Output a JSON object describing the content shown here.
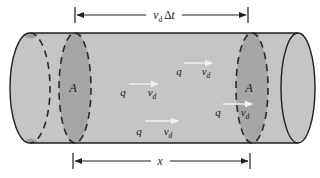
{
  "figure": {
    "colors": {
      "background": "#ffffff",
      "body": "#c5c5c5",
      "cap": "#c9c9c9",
      "cross_section": "#a6a6a6",
      "outline": "#1f1f1f",
      "charge_arrow": "#f2f2f2",
      "text": "#1a1a1a"
    },
    "top_dimension": {
      "v": "v",
      "v_sub": "d",
      "delta": "Δ",
      "t": "t"
    },
    "bottom_dimension": {
      "label": "x"
    },
    "cross_sections": [
      {
        "label": "A"
      },
      {
        "label": "A"
      }
    ],
    "charges": [
      {
        "q": "q",
        "v": "v",
        "v_sub": "d"
      },
      {
        "q": "q",
        "v": "v",
        "v_sub": "d"
      },
      {
        "q": "q",
        "v": "v",
        "v_sub": "d"
      },
      {
        "q": "q",
        "v": "v",
        "v_sub": "d"
      }
    ]
  }
}
